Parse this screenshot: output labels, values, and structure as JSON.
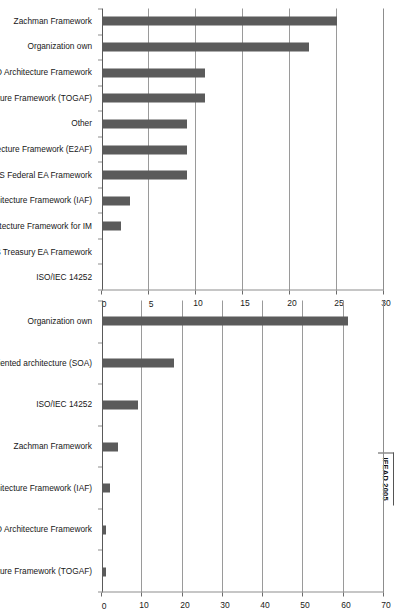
{
  "source_tag": "IFEAD 2005",
  "chart_data": [
    {
      "id": "chart-1",
      "type": "bar",
      "title": "",
      "xlabel": "",
      "ylabel": "",
      "ylim": [
        0,
        30
      ],
      "yticks": [
        0,
        5,
        10,
        15,
        20,
        25,
        30
      ],
      "grid": true,
      "legend": "none",
      "categories": [
        "Zachman Framework",
        "Organization own",
        "US DoD Architecture Framework",
        "The Open Group Architecture Framework (TOGAF)",
        "Other",
        "Extended Enterprise Architecture Framework (E2AF)",
        "US Federal EA Framework",
        "Integrated Architecture Framework (IAF)",
        "US Technical Architecture Framework for IM",
        "US Treasury EA Framework",
        "ISO/IEC 14252"
      ],
      "values": [
        25,
        22,
        11,
        11,
        9,
        9,
        9,
        3,
        2,
        0,
        0
      ]
    },
    {
      "id": "chart-2",
      "type": "bar",
      "title": "",
      "xlabel": "",
      "ylabel": "",
      "ylim": [
        0,
        70
      ],
      "yticks": [
        0,
        10,
        20,
        30,
        40,
        50,
        60,
        70
      ],
      "grid": true,
      "legend": "none",
      "categories": [
        "Organization own",
        "Service oriented architecture (SOA)",
        "ISO/IEC 14252",
        "Zachman Framework",
        "Integrated Architecture Framework (IAF)",
        "US DoD Architecture Framework",
        "The Open Group Architecture Framework (TOGAF)"
      ],
      "values": [
        61,
        18,
        9,
        4,
        2,
        1,
        1
      ]
    }
  ]
}
